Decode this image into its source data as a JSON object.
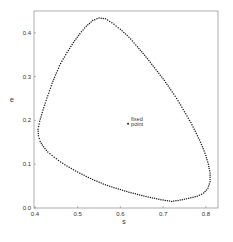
{
  "chart_data": {
    "type": "scatter",
    "title": "",
    "xlabel": "s",
    "ylabel": "e",
    "xlim": [
      0.4,
      0.82
    ],
    "ylim": [
      0.0,
      0.45
    ],
    "grid": false,
    "legend": null,
    "x_ticks": [
      "0.4",
      "0.5",
      "0.6",
      "0.7",
      "0.8"
    ],
    "y_ticks": [
      "0.0",
      "0.1",
      "0.2",
      "0.3",
      "0.4"
    ],
    "series": [
      {
        "name": "limit cycle",
        "style": "dotted closed orbit",
        "points": [
          [
            0.55,
            0.434
          ],
          [
            0.535,
            0.428
          ],
          [
            0.52,
            0.415
          ],
          [
            0.505,
            0.398
          ],
          [
            0.49,
            0.378
          ],
          [
            0.475,
            0.355
          ],
          [
            0.46,
            0.33
          ],
          [
            0.45,
            0.308
          ],
          [
            0.44,
            0.285
          ],
          [
            0.432,
            0.262
          ],
          [
            0.424,
            0.24
          ],
          [
            0.417,
            0.218
          ],
          [
            0.411,
            0.198
          ],
          [
            0.407,
            0.18
          ],
          [
            0.408,
            0.165
          ],
          [
            0.412,
            0.152
          ],
          [
            0.42,
            0.14
          ],
          [
            0.43,
            0.128
          ],
          [
            0.445,
            0.116
          ],
          [
            0.46,
            0.105
          ],
          [
            0.48,
            0.093
          ],
          [
            0.5,
            0.082
          ],
          [
            0.52,
            0.072
          ],
          [
            0.54,
            0.063
          ],
          [
            0.56,
            0.055
          ],
          [
            0.58,
            0.048
          ],
          [
            0.6,
            0.042
          ],
          [
            0.62,
            0.036
          ],
          [
            0.64,
            0.031
          ],
          [
            0.66,
            0.026
          ],
          [
            0.68,
            0.022
          ],
          [
            0.7,
            0.018
          ],
          [
            0.72,
            0.015
          ],
          [
            0.74,
            0.018
          ],
          [
            0.76,
            0.022
          ],
          [
            0.78,
            0.027
          ],
          [
            0.795,
            0.034
          ],
          [
            0.805,
            0.045
          ],
          [
            0.81,
            0.06
          ],
          [
            0.81,
            0.08
          ],
          [
            0.806,
            0.1
          ],
          [
            0.8,
            0.12
          ],
          [
            0.79,
            0.145
          ],
          [
            0.778,
            0.17
          ],
          [
            0.765,
            0.195
          ],
          [
            0.75,
            0.22
          ],
          [
            0.735,
            0.245
          ],
          [
            0.718,
            0.27
          ],
          [
            0.7,
            0.295
          ],
          [
            0.68,
            0.32
          ],
          [
            0.66,
            0.345
          ],
          [
            0.64,
            0.368
          ],
          [
            0.62,
            0.39
          ],
          [
            0.6,
            0.408
          ],
          [
            0.58,
            0.423
          ],
          [
            0.565,
            0.432
          ],
          [
            0.55,
            0.434
          ]
        ]
      }
    ],
    "annotations": [
      {
        "text": "fixed",
        "text2": "point",
        "x": 0.618,
        "y": 0.197
      }
    ]
  },
  "labels": {
    "xlabel": "s",
    "ylabel": "e",
    "fixed_line1": "fixed",
    "fixed_line2": "point"
  }
}
